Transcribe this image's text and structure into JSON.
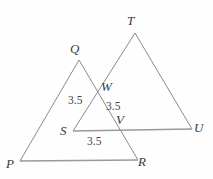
{
  "figure": {
    "background_color": "#fefefe",
    "stroke_color": "#8a8a8a",
    "label_color": "#3a3a3a",
    "measure_color": "#444444",
    "vertices": [
      {
        "id": "P",
        "label": "P",
        "x": 20,
        "y": 161,
        "label_x": 6,
        "label_y": 157
      },
      {
        "id": "Q",
        "label": "Q",
        "x": 79,
        "y": 60,
        "label_x": 70,
        "label_y": 42
      },
      {
        "id": "R",
        "label": "R",
        "x": 138,
        "y": 160,
        "label_x": 138,
        "label_y": 155
      },
      {
        "id": "S",
        "label": "S",
        "x": 73,
        "y": 131,
        "label_x": 60,
        "label_y": 124
      },
      {
        "id": "T",
        "label": "T",
        "x": 135,
        "y": 33,
        "label_x": 127,
        "label_y": 14
      },
      {
        "id": "U",
        "label": "U",
        "x": 192,
        "y": 129,
        "label_x": 194,
        "label_y": 121
      },
      {
        "id": "V",
        "label": "V",
        "x": 119,
        "y": 128,
        "label_x": 116,
        "label_y": 113
      },
      {
        "id": "W",
        "label": "W",
        "x": 98,
        "y": 90,
        "label_x": 101,
        "label_y": 80
      }
    ],
    "segments": [
      {
        "id": "PQ",
        "from": "P",
        "to": "Q"
      },
      {
        "id": "QR",
        "from": "Q",
        "to": "R"
      },
      {
        "id": "PR",
        "from": "P",
        "to": "R"
      },
      {
        "id": "ST",
        "from": "S",
        "to": "T"
      },
      {
        "id": "TU",
        "from": "T",
        "to": "U"
      },
      {
        "id": "SU",
        "from": "S",
        "to": "U"
      }
    ],
    "measures": [
      {
        "id": "SW-measure",
        "value": "3.5",
        "x": 68,
        "y": 95
      },
      {
        "id": "WV-measure",
        "value": "3.5",
        "x": 106,
        "y": 101
      },
      {
        "id": "SV-measure",
        "value": "3.5",
        "x": 87,
        "y": 136
      }
    ]
  }
}
